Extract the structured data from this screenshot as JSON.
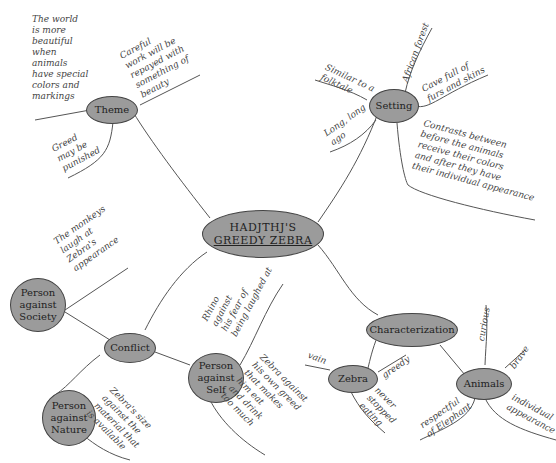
{
  "central": {
    "line1": "HADJTHJ'S",
    "line2": "GREEDY ZEBRA"
  },
  "nodes": {
    "theme": "Theme",
    "setting": "Setting",
    "conflict": "Conflict",
    "characterization": "Characterization",
    "society": "Person\nagainst\nSociety",
    "nature": "Person\nagainst\nNature",
    "self": "Person\nagainst\nSelf",
    "zebra": "Zebra",
    "animals": "Animals"
  },
  "notes": {
    "theme_world": "The world\nis more\nbeautiful\nwhen\nanimals\nhave special\ncolors and\nmarkings",
    "theme_careful": "Careful\nwork will be\nrepayed with\nsomething of\nbeauty",
    "theme_greed": "Greed\nmay be\npunished",
    "setting_folktale": "Similar to a\nfolktale",
    "setting_forest": "African forest",
    "setting_cave": "Cave full of\nfurs and skins",
    "setting_long": "Long, long\nago",
    "setting_contrast": "Contrasts between\nbefore the animals\nreceive their colors\nand after they have\ntheir individual appearance",
    "society_monkeys": "The monkeys\nlaugh at\nZebra's\nappearance",
    "nature_size": "Zebra's size\nagainst the\nmaterial that\nis available",
    "self_rhino": "Rhino\nagainst\nhis fear of\nbeing laughed at",
    "self_zebra": "Zebra against\nhis own greed\nthat makes\nhim eat\nand drink\ntoo much",
    "zebra_vain": "vain",
    "zebra_greedy": "greedy",
    "zebra_never": "never\nstopped\neating",
    "animals_curious": "curious",
    "animals_brave": "brave",
    "animals_respectful": "respectful\nof Elephant",
    "animals_individual": "individual\nappearance"
  },
  "colors": {
    "node_fill": "#9b9b9b",
    "node_border": "#444444",
    "line": "#555555"
  }
}
